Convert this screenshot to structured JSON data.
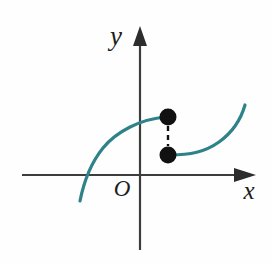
{
  "figure": {
    "background_color": "#fefefe",
    "width": 272,
    "height": 264
  },
  "axes": {
    "color": "#3d3d3d",
    "stroke_width": 2.2,
    "x_axis": {
      "label": "x",
      "label_x": 249,
      "label_y": 199,
      "y_position": 175,
      "x_start": 22,
      "x_end": 238,
      "arrow_tip_x": 256,
      "arrow_name": "x-axis-arrowhead"
    },
    "y_axis": {
      "label": "y",
      "label_x": 116,
      "label_y": 45,
      "x_position": 140,
      "y_start": 250,
      "y_end": 42,
      "arrow_tip_y": 26,
      "arrow_name": "y-axis-arrowhead"
    },
    "origin": {
      "label": "O",
      "label_x": 122,
      "label_y": 196
    }
  },
  "chart_data": {
    "type": "line",
    "xlabel": "x",
    "ylabel": "y",
    "grid": false,
    "legend": null,
    "curve_color": "#2e8289",
    "curve_stroke_width": 3.2,
    "series": [
      {
        "name": "left-branch",
        "description": "Increasing concave-down branch rising from lower left, crossing the x-axis and flattening to a closed endpoint at the jump",
        "path": "M 80,201 C 83,186 90,164 103,148 C 116,132 140,119 166,117",
        "endpoint_open": false
      },
      {
        "name": "right-branch",
        "description": "Branch beginning at the lower closed endpoint, running nearly flat then sweeping steeply upward to the right",
        "path": "M 170,155 C 190,155 205,152 219,142 C 233,132 241,119 245,105",
        "endpoint_open": false
      }
    ],
    "points": [
      {
        "name": "upper-endpoint",
        "x": 168,
        "y": 117,
        "filled": true,
        "radius": 8.5,
        "color": "#111111"
      },
      {
        "name": "lower-endpoint",
        "x": 168,
        "y": 155,
        "filled": true,
        "radius": 8.5,
        "color": "#111111"
      }
    ],
    "connector": {
      "name": "jump-dashed-connector",
      "x": 168,
      "y_top": 126,
      "y_bottom": 146,
      "style": "dashed",
      "dash_pattern": "5,4",
      "color": "#111111",
      "stroke_width": 2.4
    }
  }
}
